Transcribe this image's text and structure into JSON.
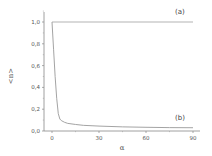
{
  "chart_data": {
    "type": "line",
    "title": "",
    "xlabel": "α",
    "ylabel": "<n>",
    "xlim": [
      0,
      90
    ],
    "ylim": [
      0.0,
      1.1
    ],
    "xticks": [
      0,
      30,
      60,
      90
    ],
    "xtick_labels": [
      "0",
      "30",
      "60",
      "90"
    ],
    "yticks": [
      0.0,
      0.2,
      0.4,
      0.6,
      0.8,
      1.0
    ],
    "ytick_labels": [
      "0,0",
      "0,2",
      "0,4",
      "0,6",
      "0,8",
      "1,0"
    ],
    "grid": false,
    "legend": "none",
    "series": [
      {
        "name": "(a)",
        "color": "#aaaaaa",
        "x": [
          0,
          90
        ],
        "y": [
          1.0,
          1.0
        ]
      },
      {
        "name": "(b)",
        "color": "#999999",
        "x": [
          0,
          1,
          2,
          3,
          4,
          5,
          6,
          8,
          10,
          15,
          20,
          30,
          45,
          60,
          75,
          90
        ],
        "y": [
          1.0,
          0.75,
          0.5,
          0.3,
          0.16,
          0.11,
          0.095,
          0.08,
          0.07,
          0.06,
          0.052,
          0.045,
          0.038,
          0.034,
          0.031,
          0.03
        ]
      }
    ],
    "annotations": [
      {
        "text": "(a)",
        "x": 85,
        "y": 1.05
      },
      {
        "text": "(b)",
        "x": 85,
        "y": 0.13
      }
    ]
  }
}
